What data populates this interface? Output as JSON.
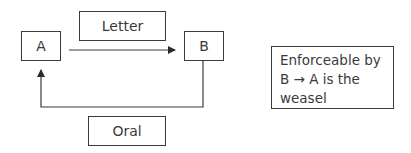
{
  "diagram": {
    "nodes": {
      "a": "A",
      "b": "B"
    },
    "labels": {
      "letter": "Letter",
      "oral": "Oral"
    },
    "note": "Enforceable by\nB → A is the\nweasel",
    "edges": [
      {
        "from": "A",
        "to": "B",
        "label": "Letter"
      },
      {
        "from": "B",
        "to": "A",
        "label": "Oral"
      }
    ],
    "colors": {
      "stroke": "#3a3a3a",
      "text": "#3a3a3a",
      "background": "#ffffff"
    }
  }
}
